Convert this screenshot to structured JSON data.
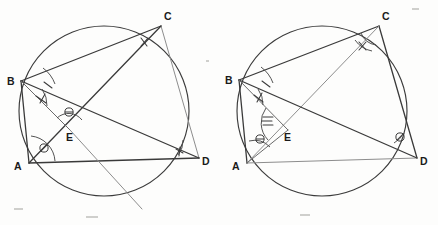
{
  "figure": {
    "background_color": "#fdfdfc",
    "stroke_color": "#3a3a3a",
    "light_stroke_color": "#8d8d8d"
  },
  "left_diagram": {
    "name": "left-circle-diagram",
    "circle": {
      "cx": 104,
      "cy": 111,
      "r": 85
    },
    "vertices": [
      {
        "id": "B",
        "label": "B",
        "x": 21,
        "y": 81,
        "label_x": 7,
        "label_y": 85
      },
      {
        "id": "C",
        "label": "C",
        "x": 161,
        "y": 26,
        "label_x": 164,
        "label_y": 20
      },
      {
        "id": "A",
        "label": "A",
        "x": 29,
        "y": 163,
        "label_x": 14,
        "label_y": 170
      },
      {
        "id": "D",
        "label": "D",
        "x": 199,
        "y": 158,
        "label_x": 202,
        "label_y": 165
      },
      {
        "id": "E",
        "label": "E",
        "x": 70,
        "y": 130,
        "label_x": 69,
        "label_y": 141
      }
    ],
    "segments": [
      {
        "name": "segment-BC",
        "from": "B",
        "to": "C",
        "weight": "heavy"
      },
      {
        "name": "segment-CD",
        "from": "C",
        "to": "D",
        "weight": "light"
      },
      {
        "name": "segment-AD",
        "from": "A",
        "to": "D",
        "weight": "heavy"
      },
      {
        "name": "segment-AB",
        "from": "A",
        "to": "B",
        "weight": "heavy"
      },
      {
        "name": "segment-AC",
        "from": "A",
        "to": "C",
        "weight": "heavy"
      },
      {
        "name": "segment-BD",
        "from": "B",
        "to": "D",
        "weight": "heavy"
      },
      {
        "name": "segment-BE-extended",
        "from": "B",
        "to": "E",
        "weight": "thin"
      },
      {
        "name": "segment-EC-ray",
        "from": "E",
        "to": "C",
        "weight": "light"
      }
    ],
    "angle_marks": [
      {
        "name": "angle-mark-B-upper",
        "vertex": "B",
        "glyph": "single-tick"
      },
      {
        "name": "angle-mark-B-lower",
        "vertex": "B",
        "glyph": "double-tick"
      },
      {
        "name": "angle-mark-A",
        "vertex": "A",
        "glyph": "circle-slash"
      },
      {
        "name": "angle-mark-E",
        "vertex": "E",
        "glyph": "circle-bar"
      },
      {
        "name": "angle-mark-C",
        "vertex": "C",
        "glyph": "double-tick"
      },
      {
        "name": "angle-mark-D",
        "vertex": "D",
        "glyph": "single-tick"
      }
    ]
  },
  "right_diagram": {
    "name": "right-circle-diagram",
    "circle": {
      "cx": 322,
      "cy": 111,
      "r": 85
    },
    "vertices": [
      {
        "id": "B",
        "label": "B",
        "x": 239,
        "y": 80,
        "label_x": 225,
        "label_y": 84
      },
      {
        "id": "C",
        "label": "C",
        "x": 379,
        "y": 26,
        "label_x": 382,
        "label_y": 20
      },
      {
        "id": "A",
        "label": "A",
        "x": 247,
        "y": 163,
        "label_x": 232,
        "label_y": 170
      },
      {
        "id": "D",
        "label": "D",
        "x": 417,
        "y": 158,
        "label_x": 420,
        "label_y": 165
      },
      {
        "id": "E",
        "label": "E",
        "x": 288,
        "y": 130,
        "label_x": 287,
        "label_y": 141
      }
    ],
    "segments": [
      {
        "name": "segment-BC",
        "from": "B",
        "to": "C",
        "weight": "heavy"
      },
      {
        "name": "segment-CD",
        "from": "C",
        "to": "D",
        "weight": "heavy"
      },
      {
        "name": "segment-AD",
        "from": "A",
        "to": "D",
        "weight": "light"
      },
      {
        "name": "segment-AB",
        "from": "A",
        "to": "B",
        "weight": "heavy"
      },
      {
        "name": "segment-AC",
        "from": "A",
        "to": "C",
        "weight": "light"
      },
      {
        "name": "segment-BD",
        "from": "B",
        "to": "D",
        "weight": "heavy"
      },
      {
        "name": "segment-BE",
        "from": "B",
        "to": "E",
        "weight": "thin"
      },
      {
        "name": "segment-AE",
        "from": "A",
        "to": "E",
        "weight": "thin"
      }
    ],
    "angle_marks": [
      {
        "name": "angle-mark-B-upper",
        "vertex": "B",
        "glyph": "single-tick"
      },
      {
        "name": "angle-mark-B-lower",
        "vertex": "B",
        "glyph": "double-tick"
      },
      {
        "name": "angle-mark-A",
        "vertex": "A",
        "glyph": "circle-bar"
      },
      {
        "name": "angle-mark-E",
        "vertex": "E",
        "glyph": "triple-tick"
      },
      {
        "name": "angle-mark-C",
        "vertex": "C",
        "glyph": "double-tick"
      },
      {
        "name": "angle-mark-D",
        "vertex": "D",
        "glyph": "circle-slash"
      }
    ]
  }
}
